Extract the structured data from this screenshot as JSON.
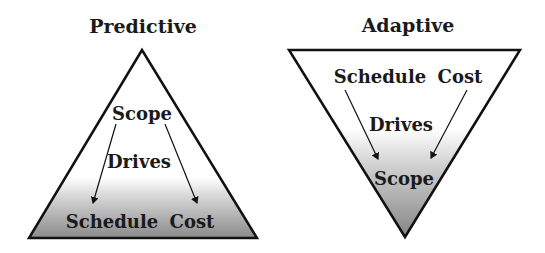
{
  "predictive": {
    "title": "Predictive",
    "top": "Scope",
    "middle": "Drives",
    "bottom_left": "Schedule",
    "bottom_right": "Cost"
  },
  "adaptive": {
    "title": "Adaptive",
    "top_left": "Schedule",
    "top_right": "Cost",
    "middle": "Drives",
    "bottom": "Scope"
  },
  "colors": {
    "outline": "#111111",
    "gradient_light": "#ffffff",
    "gradient_dark": "#8c8c8c"
  }
}
